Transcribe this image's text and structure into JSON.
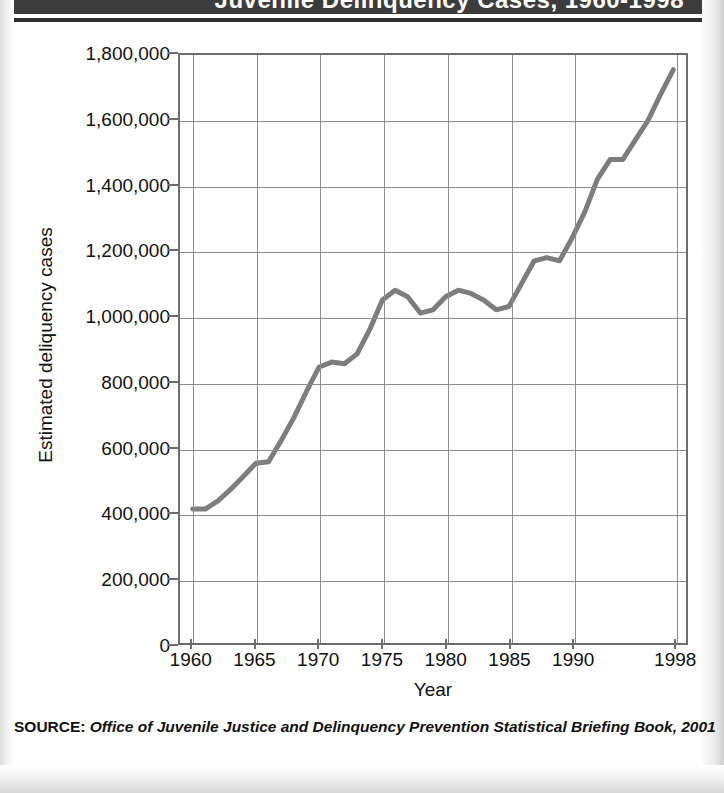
{
  "header": {
    "title": "Juvenile Delinquency Cases, 1960-1998",
    "bar_color": "#3c3c3c"
  },
  "source": {
    "label": "SOURCE:",
    "text": "Office of Juvenile Justice and Delinquency Prevention Statistical Briefing Book, 2001"
  },
  "axis_titles": {
    "x": "Year",
    "y": "Estimated deliquency cases"
  },
  "chart_data": {
    "type": "line",
    "title": "Juvenile Delinquency Cases, 1960-1998",
    "xlabel": "Year",
    "ylabel": "Estimated deliquency cases",
    "xlim": [
      1959,
      1999
    ],
    "ylim": [
      0,
      1800000
    ],
    "grid": true,
    "legend": "none",
    "line_color": "#7d7d7d",
    "line_width": 5,
    "y_ticks": [
      0,
      200000,
      400000,
      600000,
      800000,
      1000000,
      1200000,
      1400000,
      1600000,
      1800000
    ],
    "y_tick_labels": [
      "0",
      "200,000",
      "400,000",
      "600,000",
      "800,000",
      "1,000,000",
      "1,200,000",
      "1,400,000",
      "1,600,000",
      "1,800,000"
    ],
    "x_ticks": [
      1960,
      1965,
      1970,
      1975,
      1980,
      1985,
      1990,
      1998
    ],
    "x_tick_labels": [
      "1960",
      "1965",
      "1970",
      "1975",
      "1980",
      "1985",
      "1990",
      "1998"
    ],
    "x": [
      1960,
      1961,
      1962,
      1963,
      1964,
      1965,
      1966,
      1967,
      1968,
      1969,
      1970,
      1971,
      1972,
      1973,
      1974,
      1975,
      1976,
      1977,
      1978,
      1979,
      1980,
      1981,
      1982,
      1983,
      1984,
      1985,
      1986,
      1987,
      1988,
      1989,
      1990,
      1991,
      1992,
      1993,
      1994,
      1995,
      1996,
      1997,
      1998
    ],
    "values": [
      410000,
      410000,
      435000,
      470000,
      510000,
      550000,
      555000,
      620000,
      690000,
      770000,
      845000,
      860000,
      855000,
      885000,
      960000,
      1050000,
      1080000,
      1060000,
      1010000,
      1020000,
      1060000,
      1080000,
      1070000,
      1050000,
      1020000,
      1030000,
      1100000,
      1170000,
      1180000,
      1170000,
      1240000,
      1320000,
      1420000,
      1480000,
      1480000,
      1540000,
      1600000,
      1680000,
      1755000
    ],
    "series": [
      {
        "name": "Estimated delinquency cases",
        "values": [
          410000,
          410000,
          435000,
          470000,
          510000,
          550000,
          555000,
          620000,
          690000,
          770000,
          845000,
          860000,
          855000,
          885000,
          960000,
          1050000,
          1080000,
          1060000,
          1010000,
          1020000,
          1060000,
          1080000,
          1070000,
          1050000,
          1020000,
          1030000,
          1100000,
          1170000,
          1180000,
          1170000,
          1240000,
          1320000,
          1420000,
          1480000,
          1480000,
          1540000,
          1600000,
          1680000,
          1755000
        ]
      }
    ]
  }
}
